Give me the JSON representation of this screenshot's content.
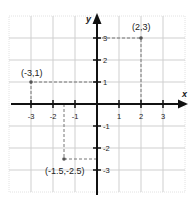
{
  "diagram": {
    "type": "coordinate_plane",
    "axes": {
      "x_label": "x",
      "y_label": "y",
      "x_ticks": [
        "-3",
        "-2",
        "-1",
        "1",
        "2",
        "3"
      ],
      "y_ticks": [
        "3",
        "2",
        "1",
        "-1",
        "-2",
        "-3"
      ]
    },
    "points": [
      {
        "label": "(2,3)",
        "x": 2,
        "y": 3
      },
      {
        "label": "(-3,1)",
        "x": -3,
        "y": 1
      },
      {
        "label": "(-1.5,-2.5)",
        "x": -1.5,
        "y": -2.5
      }
    ],
    "colors": {
      "grid": "#cfcfcf",
      "axis": "#111111",
      "dashed": "#777777",
      "text": "#222222"
    }
  }
}
